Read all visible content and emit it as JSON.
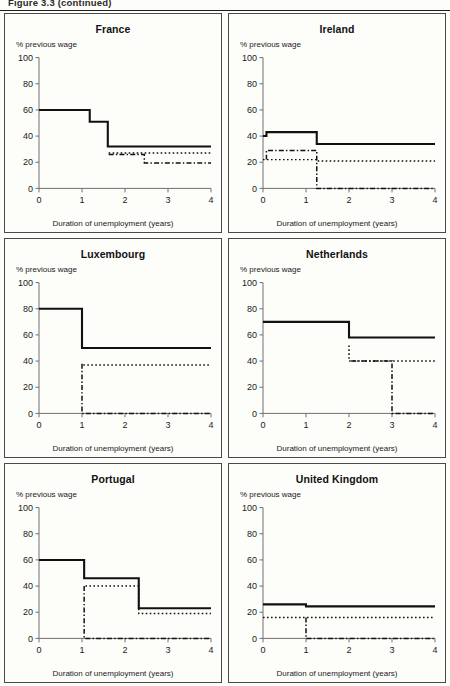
{
  "header": {
    "caption": "Figure 3.3  (continued)"
  },
  "axes": {
    "ylabel": "% previous wage",
    "xlabel": "Duration of unemployment (years)",
    "yticks": [
      0,
      20,
      40,
      60,
      80,
      100
    ],
    "xticks": [
      0,
      1,
      2,
      3,
      4
    ],
    "ylim": [
      0,
      100
    ],
    "xlim": [
      0,
      4
    ],
    "grid": false,
    "legend": "none"
  },
  "series_names": {
    "solid": "Gross replacement rate (single person)",
    "dotted": "Net replacement rate",
    "dashdot": "Unemployment insurance benefit"
  },
  "chart_data": [
    {
      "type": "line",
      "title": "France",
      "xlabel": "Duration of unemployment (years)",
      "ylabel": "% previous wage",
      "xlim": [
        0,
        4
      ],
      "ylim": [
        0,
        100
      ],
      "grid": false,
      "step": "post",
      "series": [
        {
          "name": "solid",
          "style": "solid",
          "points": [
            [
              0,
              60
            ],
            [
              1.18,
              60
            ],
            [
              1.18,
              51
            ],
            [
              1.6,
              51
            ],
            [
              1.6,
              32
            ],
            [
              4,
              32
            ]
          ]
        },
        {
          "name": "dotted",
          "style": "dotted",
          "points": [
            [
              1.62,
              27
            ],
            [
              4,
              27
            ]
          ]
        },
        {
          "name": "dashdot",
          "style": "dashdot",
          "points": [
            [
              1.62,
              26
            ],
            [
              2.45,
              26
            ],
            [
              2.45,
              19.5
            ],
            [
              4,
              19.5
            ]
          ]
        }
      ]
    },
    {
      "type": "line",
      "title": "Ireland",
      "xlabel": "Duration of unemployment (years)",
      "ylabel": "% previous wage",
      "xlim": [
        0,
        4
      ],
      "ylim": [
        0,
        100
      ],
      "grid": false,
      "step": "post",
      "series": [
        {
          "name": "solid",
          "style": "solid",
          "points": [
            [
              0,
              40
            ],
            [
              0.08,
              40
            ],
            [
              0.08,
              43
            ],
            [
              1.25,
              43
            ],
            [
              1.25,
              34
            ],
            [
              4,
              34
            ]
          ]
        },
        {
          "name": "dotted",
          "style": "dotted",
          "points": [
            [
              0,
              22
            ],
            [
              1.25,
              22
            ],
            [
              1.25,
              21
            ],
            [
              4,
              21
            ]
          ]
        },
        {
          "name": "dashdot",
          "style": "dashdot",
          "points": [
            [
              0.08,
              22
            ],
            [
              0.08,
              29
            ],
            [
              1.25,
              29
            ],
            [
              1.25,
              0
            ],
            [
              4,
              0
            ]
          ]
        }
      ]
    },
    {
      "type": "line",
      "title": "Luxembourg",
      "xlabel": "Duration of unemployment (years)",
      "ylabel": "% previous wage",
      "xlim": [
        0,
        4
      ],
      "ylim": [
        0,
        100
      ],
      "grid": false,
      "step": "post",
      "series": [
        {
          "name": "solid",
          "style": "solid",
          "points": [
            [
              0,
              80
            ],
            [
              1.0,
              80
            ],
            [
              1.0,
              50
            ],
            [
              4,
              50
            ]
          ]
        },
        {
          "name": "dotted",
          "style": "dotted",
          "points": [
            [
              1.03,
              37
            ],
            [
              4,
              37
            ]
          ]
        },
        {
          "name": "dashdot",
          "style": "dashdot",
          "points": [
            [
              1.0,
              38
            ],
            [
              1.0,
              0
            ],
            [
              4,
              0
            ]
          ]
        }
      ]
    },
    {
      "type": "line",
      "title": "Netherlands",
      "xlabel": "Duration of unemployment (years)",
      "ylabel": "% previous wage",
      "xlim": [
        0,
        4
      ],
      "ylim": [
        0,
        100
      ],
      "grid": false,
      "step": "post",
      "series": [
        {
          "name": "solid",
          "style": "solid",
          "points": [
            [
              0,
              70
            ],
            [
              2.0,
              70
            ],
            [
              2.0,
              58
            ],
            [
              4,
              58
            ]
          ]
        },
        {
          "name": "dotted",
          "style": "dotted",
          "points": [
            [
              2.0,
              52
            ],
            [
              2.0,
              40
            ],
            [
              4,
              40
            ]
          ]
        },
        {
          "name": "dashdot",
          "style": "dashdot",
          "points": [
            [
              2.05,
              40
            ],
            [
              3.0,
              40
            ],
            [
              3.0,
              0
            ],
            [
              4,
              0
            ]
          ]
        }
      ]
    },
    {
      "type": "line",
      "title": "Portugal",
      "xlabel": "Duration of unemployment (years)",
      "ylabel": "% previous wage",
      "xlim": [
        0,
        4
      ],
      "ylim": [
        0,
        100
      ],
      "grid": false,
      "step": "post",
      "series": [
        {
          "name": "solid",
          "style": "solid",
          "points": [
            [
              0,
              60
            ],
            [
              1.05,
              60
            ],
            [
              1.05,
              46
            ],
            [
              2.32,
              46
            ],
            [
              2.32,
              23
            ],
            [
              4,
              23
            ]
          ]
        },
        {
          "name": "dotted",
          "style": "dotted",
          "points": [
            [
              1.08,
              40
            ],
            [
              2.32,
              40
            ],
            [
              2.32,
              19
            ],
            [
              4,
              19
            ]
          ]
        },
        {
          "name": "dashdot",
          "style": "dashdot",
          "points": [
            [
              1.05,
              40
            ],
            [
              1.05,
              0
            ],
            [
              4,
              0
            ]
          ]
        }
      ]
    },
    {
      "type": "line",
      "title": "United Kingdom",
      "xlabel": "Duration of unemployment (years)",
      "ylabel": "% previous wage",
      "xlim": [
        0,
        4
      ],
      "ylim": [
        0,
        100
      ],
      "grid": false,
      "step": "post",
      "series": [
        {
          "name": "solid",
          "style": "solid",
          "points": [
            [
              0,
              26
            ],
            [
              1.0,
              26
            ],
            [
              1.0,
              24.5
            ],
            [
              4,
              24.5
            ]
          ]
        },
        {
          "name": "dotted",
          "style": "dotted",
          "points": [
            [
              0,
              16
            ],
            [
              4,
              16
            ]
          ]
        },
        {
          "name": "dashdot",
          "style": "dashdot",
          "points": [
            [
              1.0,
              16
            ],
            [
              1.0,
              0
            ],
            [
              4,
              0
            ]
          ]
        }
      ]
    }
  ]
}
